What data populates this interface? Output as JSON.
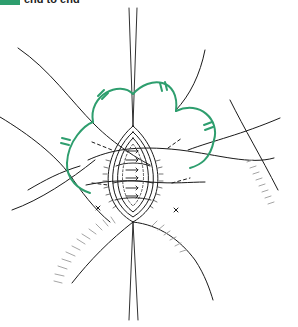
{
  "figure": {
    "label": "end to end",
    "accent_color": "#2e9e6e",
    "line_color": "#1a1a1a",
    "hatch_color": "#9a9a9a"
  }
}
